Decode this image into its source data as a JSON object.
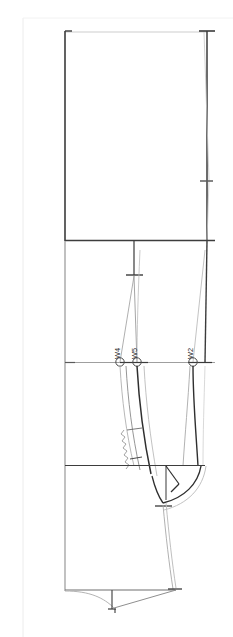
{
  "document": {
    "type": "technical-pattern-drawing",
    "title": "Trouser pattern block draft",
    "background_color": "#ffffff",
    "canvas": {
      "width": 233,
      "height": 637
    }
  },
  "colors": {
    "outline_dark": "#2b2b2b",
    "outline_mid": "#5a5a5a",
    "outline_light": "#b9b9b9",
    "guide_faint": "#e3e3e3",
    "page_border": "#ececec",
    "marker_stroke": "#4a4a4a"
  },
  "markers": [
    {
      "id": "W4",
      "label": "W4",
      "x": 120,
      "y": 362
    },
    {
      "id": "W5",
      "label": "W5",
      "x": 137,
      "y": 362
    },
    {
      "id": "W2",
      "label": "W2",
      "x": 193,
      "y": 362
    }
  ],
  "guides": {
    "waist_line_y": 32,
    "hip_line_y": 240,
    "seat_tick_y": 275,
    "crotch_line_y": 362,
    "knee_line_y": 465,
    "hem_line_y": 590,
    "left_edge_x": 65,
    "right_edge_x": 207,
    "centre_tick_x": 134
  },
  "page_border": {
    "x": 23,
    "y": 18,
    "visible": true
  }
}
